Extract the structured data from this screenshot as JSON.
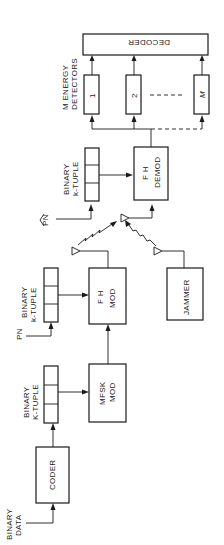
{
  "diagram": {
    "orientation": "rotated 90 degrees counter-clockwise",
    "inputs": {
      "binary_data": [
        "BINARY",
        "DATA"
      ],
      "pn_tx": "PN",
      "pn_rx": "PN"
    },
    "blocks": {
      "coder": "CODER",
      "tuple1": [
        "BINARY",
        "K-TUPLE"
      ],
      "mfsk_mod": [
        "MFSK",
        "MOD"
      ],
      "tuple2": [
        "BINARY",
        "k-TUPLE"
      ],
      "fh_mod": [
        "F H",
        "MOD"
      ],
      "jammer": "JAMMER",
      "tuple3": [
        "BINARY",
        "k-TUPLE"
      ],
      "fh_demod": [
        "F H",
        "DEMOD"
      ],
      "detectors_label": [
        "M ENERGY",
        "DETECTORS"
      ],
      "detectors": [
        "1",
        "2",
        "M"
      ],
      "decoder": "DECODER"
    }
  }
}
